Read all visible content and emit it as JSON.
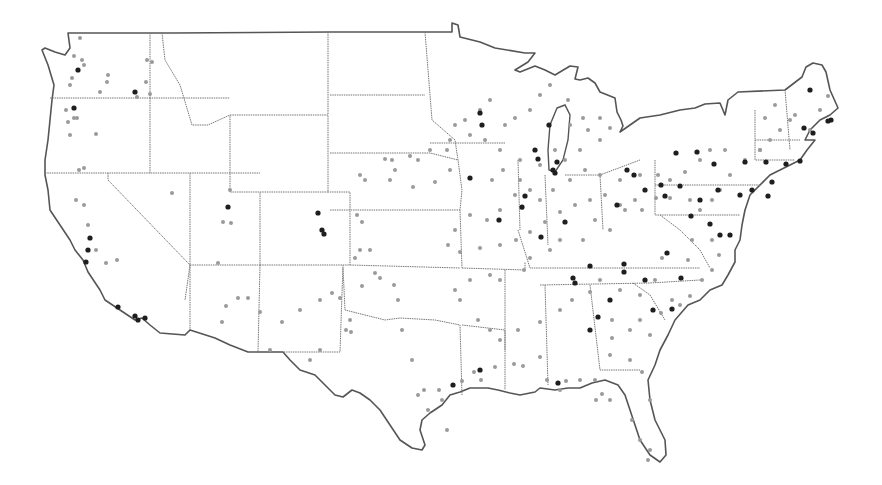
{
  "map": {
    "title": "",
    "region": "Contiguous United States",
    "colors": {
      "background": "#ffffff",
      "outline": "#555555",
      "state_border": "#777777",
      "small_place": "#9a9a9a",
      "large_city": "#1e1e1e"
    },
    "legend": [],
    "small_dots": [
      [
        80,
        38
      ],
      [
        74,
        56
      ],
      [
        82,
        60
      ],
      [
        84,
        65
      ],
      [
        72,
        78
      ],
      [
        70,
        85
      ],
      [
        107,
        82
      ],
      [
        108,
        75
      ],
      [
        100,
        92
      ],
      [
        66,
        110
      ],
      [
        74,
        118
      ],
      [
        68,
        122
      ],
      [
        77,
        118
      ],
      [
        70,
        135
      ],
      [
        96,
        134
      ],
      [
        137,
        97
      ],
      [
        147,
        60
      ],
      [
        152,
        62
      ],
      [
        146,
        82
      ],
      [
        150,
        94
      ],
      [
        84,
        168
      ],
      [
        79,
        170
      ],
      [
        76,
        200
      ],
      [
        84,
        205
      ],
      [
        88,
        225
      ],
      [
        96,
        250
      ],
      [
        106,
        263
      ],
      [
        117,
        260
      ],
      [
        172,
        193
      ],
      [
        230,
        190
      ],
      [
        223,
        222
      ],
      [
        231,
        223
      ],
      [
        218,
        263
      ],
      [
        238,
        298
      ],
      [
        226,
        306
      ],
      [
        222,
        322
      ],
      [
        248,
        298
      ],
      [
        260,
        312
      ],
      [
        270,
        350
      ],
      [
        282,
        322
      ],
      [
        300,
        310
      ],
      [
        320,
        300
      ],
      [
        346,
        330
      ],
      [
        360,
        250
      ],
      [
        370,
        250
      ],
      [
        360,
        175
      ],
      [
        365,
        180
      ],
      [
        385,
        159
      ],
      [
        392,
        160
      ],
      [
        395,
        170
      ],
      [
        390,
        180
      ],
      [
        410,
        156
      ],
      [
        418,
        160
      ],
      [
        430,
        150
      ],
      [
        447,
        150
      ],
      [
        450,
        170
      ],
      [
        413,
        187
      ],
      [
        435,
        182
      ],
      [
        357,
        215
      ],
      [
        362,
        222
      ],
      [
        355,
        258
      ],
      [
        310,
        360
      ],
      [
        320,
        350
      ],
      [
        332,
        293
      ],
      [
        340,
        298
      ],
      [
        350,
        320
      ],
      [
        351,
        332
      ],
      [
        362,
        286
      ],
      [
        375,
        273
      ],
      [
        380,
        278
      ],
      [
        394,
        285
      ],
      [
        398,
        300
      ],
      [
        402,
        330
      ],
      [
        412,
        360
      ],
      [
        418,
        395
      ],
      [
        424,
        390
      ],
      [
        428,
        410
      ],
      [
        439,
        390
      ],
      [
        442,
        400
      ],
      [
        447,
        430
      ],
      [
        462,
        381
      ],
      [
        474,
        372
      ],
      [
        481,
        380
      ],
      [
        495,
        367
      ],
      [
        514,
        364
      ],
      [
        523,
        366
      ],
      [
        540,
        357
      ],
      [
        547,
        380
      ],
      [
        560,
        390
      ],
      [
        566,
        381
      ],
      [
        580,
        380
      ],
      [
        595,
        380
      ],
      [
        602,
        394
      ],
      [
        610,
        400
      ],
      [
        596,
        400
      ],
      [
        632,
        420
      ],
      [
        640,
        440
      ],
      [
        650,
        450
      ],
      [
        648,
        460
      ],
      [
        650,
        400
      ],
      [
        642,
        372
      ],
      [
        630,
        360
      ],
      [
        610,
        355
      ],
      [
        612,
        338
      ],
      [
        612,
        320
      ],
      [
        630,
        330
      ],
      [
        640,
        320
      ],
      [
        650,
        335
      ],
      [
        661,
        313
      ],
      [
        672,
        300
      ],
      [
        680,
        305
      ],
      [
        690,
        296
      ],
      [
        702,
        280
      ],
      [
        712,
        270
      ],
      [
        719,
        255
      ],
      [
        712,
        240
      ],
      [
        692,
        240
      ],
      [
        688,
        260
      ],
      [
        662,
        258
      ],
      [
        655,
        280
      ],
      [
        640,
        295
      ],
      [
        620,
        290
      ],
      [
        600,
        280
      ],
      [
        590,
        292
      ],
      [
        572,
        300
      ],
      [
        560,
        310
      ],
      [
        540,
        322
      ],
      [
        518,
        330
      ],
      [
        500,
        340
      ],
      [
        490,
        330
      ],
      [
        478,
        320
      ],
      [
        460,
        300
      ],
      [
        455,
        290
      ],
      [
        470,
        280
      ],
      [
        490,
        275
      ],
      [
        500,
        280
      ],
      [
        524,
        270
      ],
      [
        530,
        258
      ],
      [
        550,
        250
      ],
      [
        560,
        240
      ],
      [
        583,
        240
      ],
      [
        595,
        220
      ],
      [
        610,
        230
      ],
      [
        625,
        210
      ],
      [
        642,
        210
      ],
      [
        656,
        198
      ],
      [
        670,
        198
      ],
      [
        690,
        200
      ],
      [
        700,
        210
      ],
      [
        712,
        200
      ],
      [
        720,
        190
      ],
      [
        730,
        175
      ],
      [
        745,
        160
      ],
      [
        760,
        150
      ],
      [
        770,
        140
      ],
      [
        780,
        130
      ],
      [
        795,
        115
      ],
      [
        810,
        130
      ],
      [
        820,
        110
      ],
      [
        828,
        96
      ],
      [
        790,
        120
      ],
      [
        775,
        105
      ],
      [
        765,
        118
      ],
      [
        760,
        150
      ],
      [
        725,
        150
      ],
      [
        710,
        150
      ],
      [
        700,
        160
      ],
      [
        685,
        172
      ],
      [
        670,
        180
      ],
      [
        658,
        175
      ],
      [
        640,
        175
      ],
      [
        620,
        180
      ],
      [
        600,
        175
      ],
      [
        585,
        170
      ],
      [
        570,
        180
      ],
      [
        553,
        190
      ],
      [
        540,
        200
      ],
      [
        522,
        208
      ],
      [
        500,
        210
      ],
      [
        487,
        220
      ],
      [
        470,
        215
      ],
      [
        455,
        230
      ],
      [
        448,
        245
      ],
      [
        460,
        252
      ],
      [
        480,
        248
      ],
      [
        500,
        245
      ],
      [
        516,
        240
      ],
      [
        530,
        232
      ],
      [
        545,
        222
      ],
      [
        560,
        212
      ],
      [
        575,
        205
      ],
      [
        590,
        200
      ],
      [
        605,
        195
      ],
      [
        620,
        205
      ],
      [
        635,
        200
      ],
      [
        580,
        150
      ],
      [
        588,
        130
      ],
      [
        600,
        118
      ],
      [
        610,
        128
      ],
      [
        600,
        140
      ],
      [
        583,
        118
      ],
      [
        570,
        125
      ],
      [
        568,
        100
      ],
      [
        550,
        85
      ],
      [
        540,
        95
      ],
      [
        530,
        110
      ],
      [
        515,
        118
      ],
      [
        505,
        125
      ],
      [
        490,
        100
      ],
      [
        480,
        110
      ],
      [
        465,
        120
      ],
      [
        455,
        125
      ],
      [
        450,
        140
      ],
      [
        470,
        135
      ],
      [
        485,
        140
      ],
      [
        500,
        150
      ],
      [
        520,
        160
      ],
      [
        540,
        165
      ],
      [
        555,
        150
      ],
      [
        565,
        160
      ],
      [
        503,
        170
      ],
      [
        492,
        180
      ],
      [
        520,
        180
      ],
      [
        530,
        190
      ],
      [
        515,
        195
      ]
    ],
    "large_dots": [
      [
        78,
        70
      ],
      [
        74,
        108
      ],
      [
        135,
        92
      ],
      [
        88,
        250
      ],
      [
        86,
        262
      ],
      [
        90,
        238
      ],
      [
        118,
        307
      ],
      [
        135,
        316
      ],
      [
        138,
        320
      ],
      [
        145,
        318
      ],
      [
        228,
        207
      ],
      [
        318,
        213
      ],
      [
        322,
        230
      ],
      [
        324,
        234
      ],
      [
        480,
        113
      ],
      [
        482,
        125
      ],
      [
        549,
        125
      ],
      [
        535,
        150
      ],
      [
        538,
        159
      ],
      [
        557,
        162
      ],
      [
        553,
        170
      ],
      [
        555,
        173
      ],
      [
        470,
        178
      ],
      [
        499,
        220
      ],
      [
        525,
        196
      ],
      [
        522,
        207
      ],
      [
        541,
        237
      ],
      [
        565,
        222
      ],
      [
        590,
        266
      ],
      [
        624,
        264
      ],
      [
        624,
        272
      ],
      [
        645,
        280
      ],
      [
        667,
        253
      ],
      [
        681,
        278
      ],
      [
        672,
        309
      ],
      [
        653,
        310
      ],
      [
        598,
        317
      ],
      [
        573,
        278
      ],
      [
        575,
        283
      ],
      [
        453,
        385
      ],
      [
        480,
        370
      ],
      [
        558,
        383
      ],
      [
        590,
        330
      ],
      [
        610,
        300
      ],
      [
        700,
        200
      ],
      [
        691,
        216
      ],
      [
        710,
        224
      ],
      [
        720,
        235
      ],
      [
        730,
        235
      ],
      [
        740,
        195
      ],
      [
        752,
        190
      ],
      [
        745,
        162
      ],
      [
        714,
        164
      ],
      [
        697,
        152
      ],
      [
        676,
        153
      ],
      [
        645,
        190
      ],
      [
        718,
        190
      ],
      [
        768,
        196
      ],
      [
        772,
        182
      ],
      [
        766,
        162
      ],
      [
        786,
        164
      ],
      [
        800,
        161
      ],
      [
        813,
        133
      ],
      [
        804,
        128
      ],
      [
        828,
        121
      ],
      [
        831,
        120
      ],
      [
        810,
        90
      ],
      [
        627,
        170
      ],
      [
        634,
        175
      ],
      [
        661,
        185
      ],
      [
        680,
        186
      ],
      [
        665,
        196
      ],
      [
        617,
        205
      ]
    ]
  }
}
